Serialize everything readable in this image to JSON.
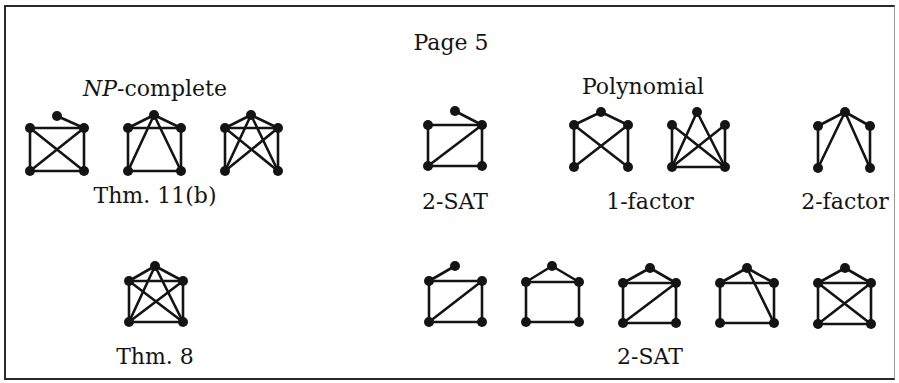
{
  "page_title": "Page 5",
  "sections": {
    "np_complete": {
      "heading_prefix": "NP",
      "heading_suffix": "-complete"
    },
    "polynomial": {
      "heading": "Polynomial"
    }
  },
  "captions": {
    "thm11b": "Thm. 11(b)",
    "sat_top": "2-SAT",
    "one_factor": "1-factor",
    "two_factor": "2-factor",
    "thm8": "Thm. 8",
    "sat_bottom": "2-SAT"
  },
  "style": {
    "ink": "#141414",
    "vertex_radius": 5,
    "edge_width": 2.6
  },
  "graphs": [
    {
      "name": "np-graph-1",
      "group": "Thm. 11(b)",
      "v": [
        [
          30,
          128
        ],
        [
          84,
          128
        ],
        [
          30,
          171
        ],
        [
          84,
          171
        ],
        [
          57,
          116
        ]
      ],
      "e": [
        [
          0,
          1
        ],
        [
          0,
          2
        ],
        [
          2,
          3
        ],
        [
          1,
          3
        ],
        [
          0,
          3
        ],
        [
          1,
          2
        ],
        [
          4,
          1
        ]
      ]
    },
    {
      "name": "np-graph-2",
      "group": "Thm. 11(b)",
      "v": [
        [
          154,
          115
        ],
        [
          128,
          128
        ],
        [
          181,
          128
        ],
        [
          128,
          171
        ],
        [
          181,
          171
        ]
      ],
      "e": [
        [
          1,
          2
        ],
        [
          1,
          3
        ],
        [
          3,
          4
        ],
        [
          2,
          4
        ],
        [
          0,
          1
        ],
        [
          0,
          2
        ],
        [
          0,
          3
        ],
        [
          0,
          4
        ]
      ]
    },
    {
      "name": "np-graph-3",
      "group": "Thm. 11(b)",
      "v": [
        [
          251,
          115
        ],
        [
          225,
          128
        ],
        [
          278,
          128
        ],
        [
          225,
          171
        ],
        [
          278,
          171
        ]
      ],
      "e": [
        [
          0,
          1
        ],
        [
          0,
          2
        ],
        [
          1,
          2
        ],
        [
          0,
          3
        ],
        [
          0,
          4
        ],
        [
          1,
          3
        ],
        [
          2,
          4
        ],
        [
          1,
          4
        ],
        [
          2,
          3
        ]
      ]
    },
    {
      "name": "poly-2sat-graph",
      "group": "2-SAT",
      "v": [
        [
          428,
          125
        ],
        [
          482,
          125
        ],
        [
          428,
          166
        ],
        [
          482,
          166
        ],
        [
          455,
          111
        ]
      ],
      "e": [
        [
          0,
          1
        ],
        [
          0,
          2
        ],
        [
          2,
          3
        ],
        [
          1,
          3
        ],
        [
          2,
          1
        ],
        [
          4,
          1
        ]
      ]
    },
    {
      "name": "poly-1factor-graph-1",
      "group": "1-factor",
      "v": [
        [
          601,
          112
        ],
        [
          574,
          125
        ],
        [
          628,
          125
        ],
        [
          574,
          167
        ],
        [
          628,
          167
        ]
      ],
      "e": [
        [
          0,
          1
        ],
        [
          0,
          2
        ],
        [
          1,
          3
        ],
        [
          2,
          4
        ],
        [
          1,
          4
        ],
        [
          2,
          3
        ]
      ]
    },
    {
      "name": "poly-1factor-graph-2",
      "group": "1-factor",
      "v": [
        [
          697,
          112
        ],
        [
          672,
          125
        ],
        [
          725,
          125
        ],
        [
          672,
          167
        ],
        [
          725,
          167
        ]
      ],
      "e": [
        [
          1,
          3
        ],
        [
          2,
          4
        ],
        [
          3,
          4
        ],
        [
          1,
          4
        ],
        [
          2,
          3
        ],
        [
          0,
          3
        ],
        [
          0,
          4
        ]
      ]
    },
    {
      "name": "poly-2factor-graph",
      "group": "2-factor",
      "v": [
        [
          845,
          112
        ],
        [
          818,
          126
        ],
        [
          870,
          126
        ],
        [
          818,
          168
        ],
        [
          870,
          168
        ]
      ],
      "e": [
        [
          0,
          1
        ],
        [
          0,
          2
        ],
        [
          0,
          3
        ],
        [
          0,
          4
        ],
        [
          1,
          3
        ],
        [
          2,
          4
        ]
      ]
    },
    {
      "name": "thm8-graph-k5",
      "group": "Thm. 8",
      "v": [
        [
          155,
          266
        ],
        [
          129,
          281
        ],
        [
          183,
          281
        ],
        [
          129,
          322
        ],
        [
          183,
          322
        ]
      ],
      "e": [
        [
          0,
          1
        ],
        [
          0,
          2
        ],
        [
          0,
          3
        ],
        [
          0,
          4
        ],
        [
          1,
          2
        ],
        [
          1,
          3
        ],
        [
          1,
          4
        ],
        [
          2,
          3
        ],
        [
          2,
          4
        ],
        [
          3,
          4
        ]
      ]
    },
    {
      "name": "bottom-2sat-graph-1",
      "group": "2-SAT",
      "v": [
        [
          455,
          266
        ],
        [
          429,
          281
        ],
        [
          482,
          281
        ],
        [
          429,
          322
        ],
        [
          482,
          322
        ]
      ],
      "e": [
        [
          0,
          1
        ],
        [
          1,
          2
        ],
        [
          1,
          3
        ],
        [
          3,
          4
        ],
        [
          2,
          4
        ],
        [
          3,
          2
        ]
      ]
    },
    {
      "name": "bottom-2sat-graph-2",
      "group": "2-SAT",
      "v": [
        [
          552,
          266
        ],
        [
          526,
          282
        ],
        [
          579,
          282
        ],
        [
          526,
          322
        ],
        [
          579,
          322
        ]
      ],
      "e": [
        [
          0,
          1
        ],
        [
          0,
          2
        ],
        [
          1,
          2
        ],
        [
          1,
          3
        ],
        [
          2,
          4
        ],
        [
          3,
          4
        ]
      ]
    },
    {
      "name": "bottom-2sat-graph-3",
      "group": "2-SAT",
      "v": [
        [
          650,
          268
        ],
        [
          623,
          283
        ],
        [
          676,
          283
        ],
        [
          623,
          323
        ],
        [
          676,
          323
        ]
      ],
      "e": [
        [
          0,
          1
        ],
        [
          0,
          2
        ],
        [
          1,
          2
        ],
        [
          1,
          3
        ],
        [
          2,
          4
        ],
        [
          3,
          4
        ],
        [
          3,
          2
        ]
      ]
    },
    {
      "name": "bottom-2sat-graph-4",
      "group": "2-SAT",
      "v": [
        [
          747,
          268
        ],
        [
          720,
          283
        ],
        [
          774,
          283
        ],
        [
          720,
          323
        ],
        [
          774,
          323
        ]
      ],
      "e": [
        [
          0,
          1
        ],
        [
          0,
          2
        ],
        [
          1,
          2
        ],
        [
          1,
          3
        ],
        [
          2,
          4
        ],
        [
          3,
          4
        ],
        [
          0,
          4
        ]
      ]
    },
    {
      "name": "bottom-2sat-graph-5",
      "group": "2-SAT",
      "v": [
        [
          845,
          268
        ],
        [
          818,
          283
        ],
        [
          871,
          283
        ],
        [
          818,
          324
        ],
        [
          871,
          324
        ]
      ],
      "e": [
        [
          0,
          1
        ],
        [
          0,
          2
        ],
        [
          1,
          2
        ],
        [
          1,
          3
        ],
        [
          2,
          4
        ],
        [
          3,
          4
        ],
        [
          1,
          4
        ],
        [
          2,
          3
        ]
      ]
    }
  ]
}
